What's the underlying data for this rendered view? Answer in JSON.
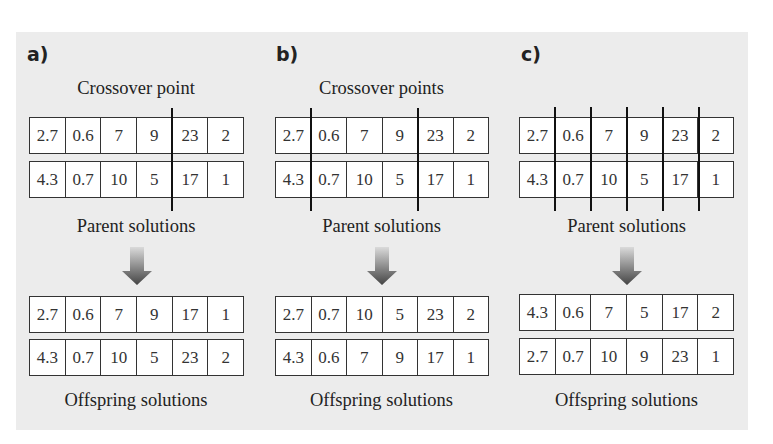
{
  "panels": [
    {
      "label": "a)",
      "title": "Crossover point",
      "parent_caption": "Parent solutions",
      "offspring_caption": "Offspring solutions",
      "crossover_after_cells": [
        4
      ],
      "parents": [
        [
          "2.7",
          "0.6",
          "7",
          "9",
          "23",
          "2"
        ],
        [
          "4.3",
          "0.7",
          "10",
          "5",
          "17",
          "1"
        ]
      ],
      "offspring": [
        [
          "2.7",
          "0.6",
          "7",
          "9",
          "17",
          "1"
        ],
        [
          "4.3",
          "0.7",
          "10",
          "5",
          "23",
          "2"
        ]
      ]
    },
    {
      "label": "b)",
      "title": "Crossover points",
      "parent_caption": "Parent solutions",
      "offspring_caption": "Offspring solutions",
      "crossover_after_cells": [
        1,
        4
      ],
      "parents": [
        [
          "2.7",
          "0.6",
          "7",
          "9",
          "23",
          "2"
        ],
        [
          "4.3",
          "0.7",
          "10",
          "5",
          "17",
          "1"
        ]
      ],
      "offspring": [
        [
          "2.7",
          "0.7",
          "10",
          "5",
          "23",
          "2"
        ],
        [
          "4.3",
          "0.6",
          "7",
          "9",
          "17",
          "1"
        ]
      ]
    },
    {
      "label": "c)",
      "title": "",
      "parent_caption": "Parent solutions",
      "offspring_caption": "Offspring solutions",
      "crossover_after_cells": [
        1,
        2,
        3,
        4,
        5
      ],
      "parents": [
        [
          "2.7",
          "0.6",
          "7",
          "9",
          "23",
          "2"
        ],
        [
          "4.3",
          "0.7",
          "10",
          "5",
          "17",
          "1"
        ]
      ],
      "offspring": [
        [
          "4.3",
          "0.6",
          "7",
          "5",
          "17",
          "2"
        ],
        [
          "2.7",
          "0.7",
          "10",
          "9",
          "23",
          "1"
        ]
      ]
    }
  ],
  "icons": {
    "arrow": "down-arrow-icon"
  },
  "colors": {
    "panel_background": "#ececec",
    "cell_background": "#ffffff",
    "border": "#333333",
    "crossover_line": "#111111",
    "arrow_top": "#d6d6d6",
    "arrow_bottom": "#4a4a4a"
  }
}
